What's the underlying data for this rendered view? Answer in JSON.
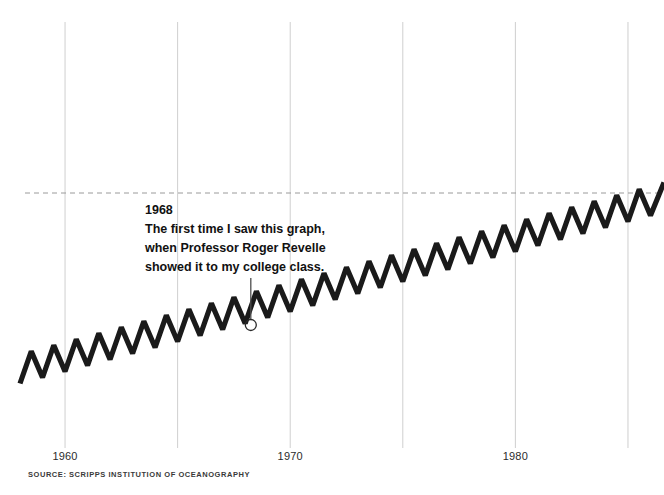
{
  "chart_data": {
    "type": "line",
    "title": "",
    "subtitle": "",
    "xlabel": "",
    "ylabel": "",
    "source": "SOURCE: SCRIPPS INSTITUTION OF OCEANOGRAPHY",
    "grid": true,
    "legend_position": "none",
    "xlim": [
      1958,
      1986.6
    ],
    "ylim": [
      310,
      350
    ],
    "x_tick_labels": [
      "1960",
      "1970",
      "1980"
    ],
    "x_tick_values": [
      1960,
      1970,
      1980
    ],
    "gridline_values": [
      1960,
      1965,
      1970,
      1975,
      1980,
      1985
    ],
    "reference_line": {
      "label": "",
      "value": 340,
      "style": "dashed",
      "color": "#9a9a9a"
    },
    "series": [
      {
        "name": "Atmospheric CO2 (Keeling Curve)",
        "color": "#1a1a1a",
        "description": "Annual sawtooth oscillation superimposed on a rising trend",
        "x": [
          1958.0,
          1958.5,
          1959.0,
          1959.5,
          1960.0,
          1960.5,
          1961.0,
          1961.5,
          1962.0,
          1962.5,
          1963.0,
          1963.5,
          1964.0,
          1964.5,
          1965.0,
          1965.5,
          1966.0,
          1966.5,
          1967.0,
          1967.5,
          1968.0,
          1968.5,
          1969.0,
          1969.5,
          1970.0,
          1970.5,
          1971.0,
          1971.5,
          1972.0,
          1972.5,
          1973.0,
          1973.5,
          1974.0,
          1974.5,
          1975.0,
          1975.5,
          1976.0,
          1976.5,
          1977.0,
          1977.5,
          1978.0,
          1978.5,
          1979.0,
          1979.5,
          1980.0,
          1980.5,
          1981.0,
          1981.5,
          1982.0,
          1982.5,
          1983.0,
          1983.5,
          1984.0,
          1984.5,
          1985.0,
          1985.5,
          1986.0,
          1986.6
        ],
        "y": [
          314.6,
          318.9,
          315.4,
          319.7,
          316.2,
          320.5,
          317.0,
          321.3,
          317.8,
          322.1,
          318.6,
          322.9,
          319.4,
          323.7,
          320.2,
          324.5,
          321.0,
          325.3,
          321.8,
          326.1,
          322.6,
          326.9,
          323.4,
          327.7,
          324.2,
          328.5,
          325.0,
          329.3,
          325.8,
          330.1,
          326.6,
          330.9,
          327.4,
          331.7,
          328.2,
          332.5,
          329.0,
          333.3,
          329.8,
          334.1,
          330.6,
          334.9,
          331.4,
          335.7,
          332.2,
          336.5,
          333.0,
          337.3,
          333.8,
          338.1,
          334.6,
          338.9,
          335.4,
          339.7,
          336.2,
          340.5,
          337.0,
          341.4
        ]
      }
    ],
    "annotations": [
      {
        "year_label": "1968",
        "lines": [
          "The first time I saw this graph,",
          "when Professor Roger Revelle",
          "showed it to my college class."
        ],
        "marker_x": 1968.25,
        "marker_y": 322.4,
        "marker_shape": "circle"
      }
    ]
  },
  "colors": {
    "background": "#ffffff",
    "ink": "#1a1a1a",
    "gridline": "#cfcfcf",
    "reference_dash": "#9a9a9a",
    "tick_text": "#2b2b2b",
    "source_text": "#3a3a3a"
  }
}
